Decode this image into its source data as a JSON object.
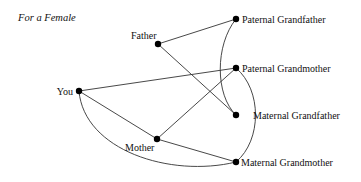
{
  "title": "For a Female",
  "nodes": [
    {
      "id": "you",
      "label": "You",
      "x": 79,
      "y": 91,
      "label_x": 73,
      "label_y": 95,
      "anchor": "end"
    },
    {
      "id": "father",
      "label": "Father",
      "x": 158,
      "y": 44,
      "label_x": 131,
      "label_y": 39,
      "anchor": "start"
    },
    {
      "id": "mother",
      "label": "Mother",
      "x": 157,
      "y": 139,
      "label_x": 125,
      "label_y": 151,
      "anchor": "start"
    },
    {
      "id": "pgf",
      "label": "Paternal Grandfather",
      "x": 236,
      "y": 19,
      "label_x": 242,
      "label_y": 23,
      "anchor": "start"
    },
    {
      "id": "pgm",
      "label": "Paternal Grandmother",
      "x": 236,
      "y": 68,
      "label_x": 242,
      "label_y": 72,
      "anchor": "start"
    },
    {
      "id": "mgf",
      "label": "Maternal Grandfather",
      "x": 236,
      "y": 115,
      "label_x": 253,
      "label_y": 119,
      "anchor": "start"
    },
    {
      "id": "mgm",
      "label": "Maternal Grandmother",
      "x": 236,
      "y": 162,
      "label_x": 241,
      "label_y": 166,
      "anchor": "start"
    }
  ],
  "edges": [
    {
      "from": "father",
      "to": "pgf",
      "type": "line"
    },
    {
      "from": "father",
      "to": "mgf",
      "type": "line"
    },
    {
      "from": "you",
      "to": "pgm",
      "type": "line"
    },
    {
      "from": "you",
      "to": "mother",
      "type": "line"
    },
    {
      "from": "mother",
      "to": "pgm",
      "type": "line"
    },
    {
      "from": "mother",
      "to": "mgm",
      "type": "line"
    },
    {
      "from": "you",
      "to": "mgm",
      "type": "curve",
      "path": "M79,91 C84,150 170,178 236,162"
    },
    {
      "from": "pgf",
      "to": "mgf",
      "type": "curve",
      "path": "M236,19 C215,45 215,95 236,115"
    },
    {
      "from": "pgm",
      "to": "mgm",
      "type": "curve",
      "path": "M236,68 C262,90 262,140 236,162"
    }
  ],
  "colors": {
    "node": "#000000",
    "edge": "#333333",
    "text": "#111111",
    "background": "#ffffff"
  }
}
